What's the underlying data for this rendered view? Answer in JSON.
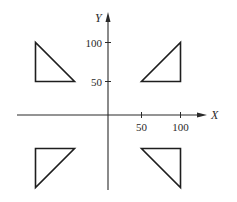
{
  "diagram": {
    "title": "",
    "x_axis": {
      "label": "X",
      "ticks": [
        50,
        100
      ],
      "tick_labels": [
        "50",
        "100"
      ]
    },
    "y_axis": {
      "label": "Y",
      "ticks": [
        50,
        100
      ],
      "tick_labels": [
        "50",
        "100"
      ]
    },
    "shapes": [
      {
        "name": "triangle-quadrant-1",
        "points": [
          [
            50,
            50
          ],
          [
            100,
            50
          ],
          [
            100,
            100
          ]
        ]
      },
      {
        "name": "triangle-quadrant-2",
        "points": [
          [
            -100,
            100
          ],
          [
            -100,
            50
          ],
          [
            -50,
            50
          ]
        ]
      },
      {
        "name": "triangle-quadrant-3",
        "points": [
          [
            -100,
            -50
          ],
          [
            -50,
            -50
          ],
          [
            -100,
            -100
          ]
        ]
      },
      {
        "name": "triangle-quadrant-4",
        "points": [
          [
            50,
            -50
          ],
          [
            100,
            -50
          ],
          [
            100,
            -100
          ]
        ]
      }
    ],
    "colors": {
      "stroke": "#1e1e1e",
      "axis": "#2a2a2a",
      "background": "#ffffff"
    }
  }
}
